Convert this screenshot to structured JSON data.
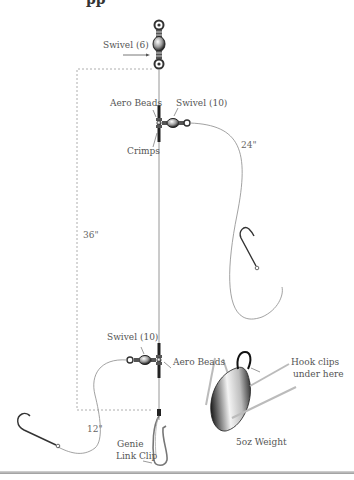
{
  "diagram": {
    "title_fragment": "pp",
    "labels": {
      "swivel_top": "Swivel (6)",
      "aero_beads_top": "Aero Beads",
      "swivel_upper": "Swivel (10)",
      "crimps": "Crimps",
      "dim_upper_leader": "24\"",
      "dim_main": "36\"",
      "swivel_lower": "Swivel (10)",
      "aero_beads_lower": "Aero Beads",
      "dim_lower_leader": "12\"",
      "genie_clip_line1": "Genie",
      "genie_clip_line2": "Link Clip",
      "hook_clips_line1": "Hook clips",
      "hook_clips_line2": "under here",
      "weight": "5oz Weight"
    },
    "colors": {
      "line": "#8a8a8a",
      "dashed": "#9a9a9a",
      "hardware": "#3a3a3a",
      "text": "#555555"
    }
  }
}
